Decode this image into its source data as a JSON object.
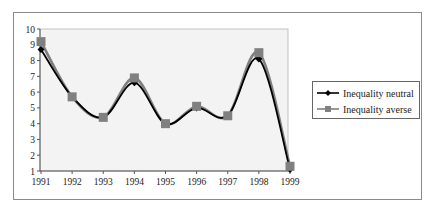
{
  "chart_data": {
    "type": "line",
    "title": "",
    "xlabel": "",
    "ylabel": "",
    "x": [
      "1991",
      "1992",
      "1993",
      "1994",
      "1995",
      "1996",
      "1997",
      "1998",
      "1999"
    ],
    "y_ticks": [
      "1",
      "2",
      "3",
      "4",
      "5",
      "6",
      "7",
      "8",
      "9",
      "10"
    ],
    "ylim": [
      1,
      10
    ],
    "grid": false,
    "legend_position": "right",
    "smooth": true,
    "series": [
      {
        "name": "Inequality neutral",
        "marker": "diamond",
        "color": "#000000",
        "values": [
          8.7,
          5.7,
          4.4,
          6.6,
          4.0,
          5.0,
          4.5,
          8.1,
          1.1
        ]
      },
      {
        "name": "Inequality averse",
        "marker": "square",
        "color": "#808080",
        "values": [
          9.2,
          5.7,
          4.4,
          6.9,
          4.0,
          5.1,
          4.5,
          8.5,
          1.3
        ]
      }
    ]
  },
  "legend": {
    "items": [
      {
        "label": "Inequality neutral"
      },
      {
        "label": "Inequality averse"
      }
    ]
  }
}
